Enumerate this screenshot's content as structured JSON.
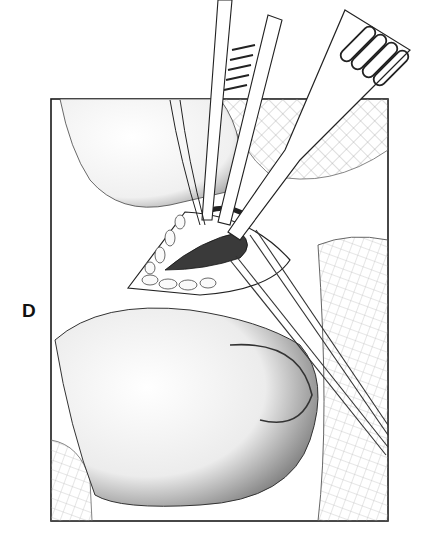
{
  "figure": {
    "panel_label": "D",
    "colors": {
      "ink": "#1a1a1a",
      "paper": "#ffffff",
      "shade": "#9a9a9a"
    }
  }
}
